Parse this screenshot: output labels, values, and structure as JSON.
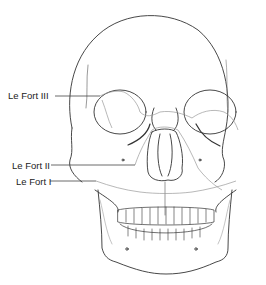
{
  "figure": {
    "labels": [
      {
        "text": "Le Fort III",
        "x": 8,
        "y": 90,
        "line_end_x": 100,
        "line_y": 96
      },
      {
        "text": "Le Fort II",
        "x": 12,
        "y": 160,
        "line_end_x": 135,
        "line_y": 165
      },
      {
        "text": "Le Fort I",
        "x": 16,
        "y": 176,
        "line_end_x": 96,
        "line_y": 181
      }
    ],
    "colors": {
      "outline": "#333333",
      "fracture": "#9a9a9a",
      "background": "#ffffff"
    }
  }
}
